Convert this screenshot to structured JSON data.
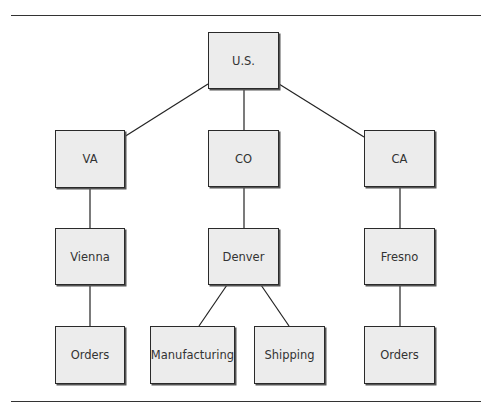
{
  "diagram": {
    "type": "org-tree",
    "nodes": [
      {
        "id": "us",
        "label": "U.S."
      },
      {
        "id": "va",
        "label": "VA"
      },
      {
        "id": "co",
        "label": "CO"
      },
      {
        "id": "ca",
        "label": "CA"
      },
      {
        "id": "vienna",
        "label": "Vienna"
      },
      {
        "id": "denver",
        "label": "Denver"
      },
      {
        "id": "fresno",
        "label": "Fresno"
      },
      {
        "id": "orders_va",
        "label": "Orders"
      },
      {
        "id": "manufacturing",
        "label": "Manufacturing"
      },
      {
        "id": "shipping",
        "label": "Shipping"
      },
      {
        "id": "orders_ca",
        "label": "Orders"
      }
    ],
    "edges": [
      [
        "us",
        "va"
      ],
      [
        "us",
        "co"
      ],
      [
        "us",
        "ca"
      ],
      [
        "va",
        "vienna"
      ],
      [
        "co",
        "denver"
      ],
      [
        "ca",
        "fresno"
      ],
      [
        "vienna",
        "orders_va"
      ],
      [
        "denver",
        "manufacturing"
      ],
      [
        "denver",
        "shipping"
      ],
      [
        "fresno",
        "orders_ca"
      ]
    ]
  }
}
